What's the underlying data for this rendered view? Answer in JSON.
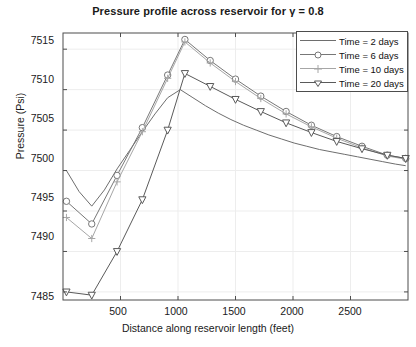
{
  "chart_data": {
    "type": "line",
    "title": "Pressure profile across reservoir for γ = 0.8",
    "xlabel": "Distance along reservoir length (feet)",
    "ylabel": "Pressure (Psi)",
    "xlim": [
      0,
      3000
    ],
    "ylim": [
      7484,
      7517
    ],
    "xticks": [
      500,
      1000,
      1500,
      2000,
      2500
    ],
    "yticks": [
      7485,
      7490,
      7495,
      7500,
      7505,
      7510,
      7515
    ],
    "grid": true,
    "legend_position": "top-right",
    "legend_entries": [
      "Time = 2 days",
      "Time = 6 days",
      "Time = 10 days",
      "Time = 20 days"
    ],
    "series": [
      {
        "name": "Time = 2 days",
        "marker": "none",
        "color": "#6e6e6e",
        "x": [
          30,
          140,
          250,
          360,
          470,
          580,
          690,
          800,
          910,
          1020,
          1130,
          1240,
          1350,
          1460,
          1570,
          1680,
          1790,
          1900,
          2010,
          2120,
          2230,
          2340,
          2450,
          2560,
          2670,
          2780,
          2890,
          2980
        ],
        "values": [
          7500.0,
          7497.4,
          7495.6,
          7497.6,
          7500.2,
          7502.5,
          7504.8,
          7507.0,
          7509.0,
          7510.0,
          7509.0,
          7508.0,
          7507.1,
          7506.3,
          7505.6,
          7505.0,
          7504.4,
          7503.9,
          7503.4,
          7503.0,
          7502.6,
          7502.3,
          7502.0,
          7501.7,
          7501.4,
          7501.1,
          7500.8,
          7500.6
        ]
      },
      {
        "name": "Time = 6 days",
        "marker": "circle",
        "color": "#777777",
        "x": [
          30,
          250,
          470,
          690,
          910,
          1060,
          1280,
          1500,
          1720,
          1940,
          2160,
          2380,
          2600,
          2820,
          2980
        ],
        "values": [
          7496.2,
          7493.4,
          7499.4,
          7505.3,
          7511.8,
          7516.2,
          7513.6,
          7511.3,
          7509.2,
          7507.3,
          7505.6,
          7504.2,
          7503.0,
          7501.9,
          7501.5
        ]
      },
      {
        "name": "Time = 10 days",
        "marker": "plus",
        "color": "#a6a6a6",
        "x": [
          30,
          250,
          470,
          690,
          910,
          1060,
          1280,
          1500,
          1720,
          1940,
          2160,
          2380,
          2600,
          2820,
          2980
        ],
        "values": [
          7494.2,
          7491.6,
          7498.6,
          7504.8,
          7511.4,
          7515.9,
          7513.3,
          7511.0,
          7508.9,
          7507.0,
          7505.4,
          7504.0,
          7502.8,
          7501.8,
          7501.4
        ]
      },
      {
        "name": "Time = 20 days",
        "marker": "triangle-down",
        "color": "#5a5a5a",
        "x": [
          30,
          250,
          470,
          690,
          910,
          1060,
          1280,
          1500,
          1720,
          1940,
          2160,
          2380,
          2600,
          2820,
          2980
        ],
        "values": [
          7485.0,
          7484.6,
          7490.0,
          7496.4,
          7505.0,
          7512.0,
          7510.4,
          7508.8,
          7507.3,
          7505.9,
          7504.7,
          7503.6,
          7502.7,
          7501.9,
          7501.5
        ]
      }
    ]
  },
  "axes": {
    "ytick_labels": [
      "7515",
      "7510",
      "7505",
      "7500",
      "7495",
      "7490",
      "7485"
    ],
    "xtick_labels": [
      "500",
      "1000",
      "1500",
      "2000",
      "2500"
    ]
  }
}
